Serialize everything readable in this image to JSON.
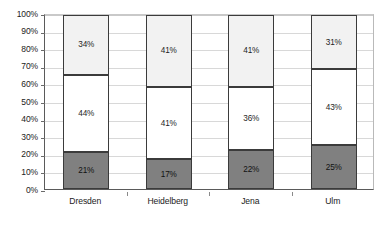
{
  "chart_data": {
    "type": "bar",
    "subtype": "stacked-100-percent",
    "title": "",
    "subtitle": "",
    "xlabel": "",
    "ylabel": "",
    "ylim": [
      0,
      100
    ],
    "y_tick_labels": [
      "0%",
      "10%",
      "20%",
      "30%",
      "40%",
      "50%",
      "60%",
      "70%",
      "80%",
      "90%",
      "100%"
    ],
    "y_tick_values": [
      0,
      10,
      20,
      30,
      40,
      50,
      60,
      70,
      80,
      90,
      100
    ],
    "grid": true,
    "grid_axis": "y",
    "legend": false,
    "legend_position": "none",
    "categories": [
      "Dresden",
      "Heidelberg",
      "Jena",
      "Ulm"
    ],
    "series": [
      {
        "name": "bottom-segment",
        "color": "#808080",
        "values": [
          21,
          17,
          22,
          25
        ],
        "labels": [
          "21%",
          "17%",
          "22%",
          "25%"
        ]
      },
      {
        "name": "middle-segment",
        "color": "#ffffff",
        "values": [
          44,
          41,
          36,
          43
        ],
        "labels": [
          "44%",
          "41%",
          "36%",
          "43%"
        ]
      },
      {
        "name": "top-segment",
        "color": "#f2f2f2",
        "values": [
          34,
          41,
          41,
          31
        ],
        "labels": [
          "34%",
          "41%",
          "41%",
          "31%"
        ]
      }
    ],
    "colors": {
      "bottom": "#808080",
      "middle": "#ffffff",
      "top": "#f2f2f2",
      "bar_border": "#3b3b3b",
      "gridline": "#d8d8d8",
      "axis": "#5a5a5a",
      "text": "#222222",
      "background": "#ffffff"
    }
  }
}
